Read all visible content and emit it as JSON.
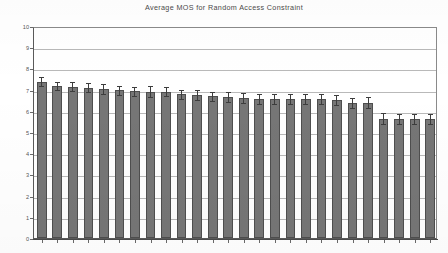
{
  "chart_data": {
    "type": "bar",
    "title": "Average MOS for Random Access Constraint",
    "xlabel": "",
    "ylabel": "",
    "ylim": [
      0,
      10
    ],
    "ytick_step": 1,
    "ytick_labels": [
      "10",
      "9",
      "8",
      "7",
      "6",
      "5",
      "4",
      "3",
      "2",
      "1",
      "0"
    ],
    "grid": true,
    "legend": "none",
    "bar_color": "#767676",
    "bar_edge_color": "#4e4e4e",
    "error_bar_color": "#3d3d3d",
    "gridline_color": "#b9b9b9",
    "axis_color": "#4a4a4a",
    "categories": [
      "1",
      "2",
      "3",
      "4",
      "5",
      "6",
      "7",
      "8",
      "9",
      "10",
      "11",
      "12",
      "13",
      "14",
      "15",
      "16",
      "17",
      "18",
      "19",
      "20",
      "21",
      "22",
      "23",
      "24",
      "25",
      "26"
    ],
    "values": [
      7.38,
      7.17,
      7.14,
      7.08,
      7.03,
      6.97,
      6.92,
      6.91,
      6.9,
      6.77,
      6.74,
      6.68,
      6.66,
      6.59,
      6.57,
      6.57,
      6.56,
      6.55,
      6.55,
      6.51,
      6.38,
      6.39,
      5.63,
      5.62,
      5.62,
      5.6
    ],
    "errors": [
      0.2,
      0.21,
      0.22,
      0.21,
      0.23,
      0.21,
      0.21,
      0.24,
      0.22,
      0.22,
      0.24,
      0.22,
      0.23,
      0.23,
      0.23,
      0.24,
      0.24,
      0.23,
      0.24,
      0.24,
      0.23,
      0.26,
      0.25,
      0.24,
      0.24,
      0.24
    ],
    "series": [
      {
        "name": "Average MOS",
        "values": [
          7.38,
          7.17,
          7.14,
          7.08,
          7.03,
          6.97,
          6.92,
          6.91,
          6.9,
          6.77,
          6.74,
          6.68,
          6.66,
          6.59,
          6.57,
          6.57,
          6.56,
          6.55,
          6.55,
          6.51,
          6.38,
          6.39,
          5.63,
          5.62,
          5.62,
          5.6
        ]
      }
    ]
  },
  "chart": {
    "title": "Average MOS for Random Access Constraint"
  }
}
